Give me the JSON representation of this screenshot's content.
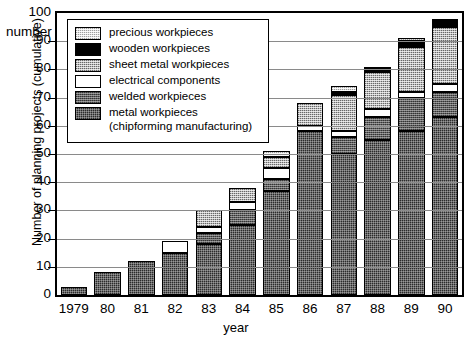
{
  "chart_data": {
    "type": "bar",
    "subtype": "stacked",
    "title": "",
    "xlabel": "year",
    "ylabel": "Number of planning projects (cumulative)",
    "y_unit_label": "number",
    "ylim": [
      0,
      100
    ],
    "yticks": [
      0,
      10,
      20,
      30,
      40,
      50,
      60,
      70,
      80,
      90,
      100
    ],
    "grid": true,
    "legend_position": "top-left-inside",
    "categories": [
      "1979",
      "80",
      "81",
      "82",
      "83",
      "84",
      "85",
      "86",
      "87",
      "88",
      "89",
      "90"
    ],
    "series": [
      {
        "name": "metal workpieces (chipforming manufacturing)",
        "key": "metal",
        "color": "#2b2b2b",
        "values": [
          3,
          8,
          12,
          15,
          18,
          25,
          37,
          58,
          50,
          55,
          58,
          63
        ]
      },
      {
        "name": "welded workpieces",
        "key": "welded",
        "color": "#5e5e5e",
        "values": [
          0,
          0,
          0,
          0,
          4,
          5,
          4,
          0,
          6,
          8,
          12,
          9
        ]
      },
      {
        "name": "electrical components",
        "key": "electrical",
        "color": "#ffffff",
        "values": [
          0,
          0,
          0,
          4,
          2,
          3,
          4,
          2,
          2,
          3,
          2,
          3
        ]
      },
      {
        "name": "sheet metal workpieces",
        "key": "sheet",
        "color": "#b9b9b9",
        "values": [
          0,
          0,
          0,
          0,
          6,
          5,
          4,
          8,
          13,
          13,
          16,
          20
        ]
      },
      {
        "name": "wooden workpieces",
        "key": "wooden",
        "color": "#000000",
        "values": [
          0,
          0,
          0,
          0,
          0,
          0,
          0,
          0,
          1,
          1,
          2,
          2
        ]
      },
      {
        "name": "precious workpieces",
        "key": "precious",
        "color": "#e2e2e2",
        "values": [
          0,
          0,
          0,
          0,
          0,
          0,
          2,
          0,
          2,
          1,
          1,
          1
        ]
      }
    ],
    "totals": [
      3,
      8,
      12,
      19,
      30,
      38,
      51,
      68,
      74,
      81,
      91,
      98
    ]
  },
  "legend": {
    "items": [
      {
        "label": "precious workpieces",
        "key": "precious"
      },
      {
        "label": "wooden workpieces",
        "key": "wooden"
      },
      {
        "label": "sheet metal workpieces",
        "key": "sheet"
      },
      {
        "label": "electrical components",
        "key": "electrical"
      },
      {
        "label": "welded workpieces",
        "key": "welded"
      },
      {
        "label": "metal workpieces\n(chipforming manufacturing)",
        "key": "metal"
      }
    ]
  }
}
